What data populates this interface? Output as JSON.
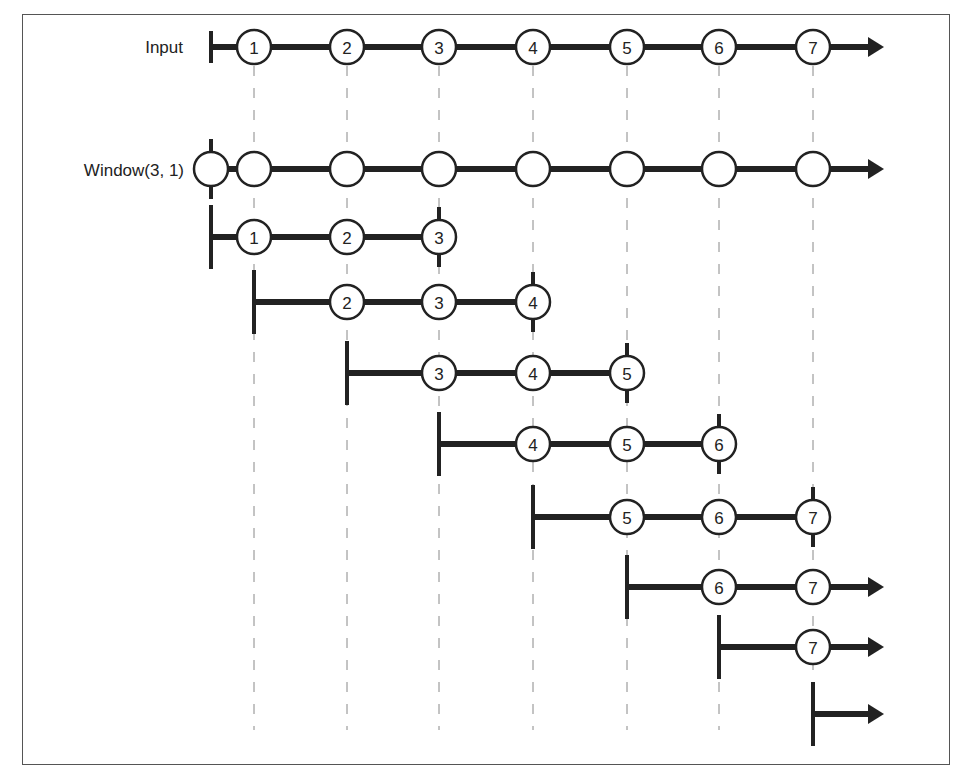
{
  "diagram": {
    "input_label": "Input",
    "window_label": "Window(3, 1)",
    "events": [
      "1",
      "2",
      "3",
      "4",
      "5",
      "6",
      "7"
    ],
    "event_x": [
      254,
      347,
      439,
      533,
      627,
      719,
      813
    ],
    "windows": [
      {
        "start_x": 211,
        "y": 237,
        "items": [
          "1",
          "2",
          "3"
        ],
        "completed": true
      },
      {
        "start_x": 254,
        "y": 302,
        "items": [
          "2",
          "3",
          "4"
        ],
        "completed": true
      },
      {
        "start_x": 347,
        "y": 373,
        "items": [
          "3",
          "4",
          "5"
        ],
        "completed": true
      },
      {
        "start_x": 439,
        "y": 444,
        "items": [
          "4",
          "5",
          "6"
        ],
        "completed": true
      },
      {
        "start_x": 533,
        "y": 517,
        "items": [
          "5",
          "6",
          "7"
        ],
        "completed": true
      },
      {
        "start_x": 627,
        "y": 587,
        "items": [
          "6",
          "7"
        ],
        "completed": false
      },
      {
        "start_x": 719,
        "y": 647,
        "items": [
          "7"
        ],
        "completed": false
      },
      {
        "start_x": 813,
        "y": 714,
        "items": [],
        "completed": false
      }
    ],
    "colors": {
      "line": "#222222",
      "dash": "#888888",
      "frame": "#555555",
      "circle_fill": "#ffffff"
    }
  }
}
